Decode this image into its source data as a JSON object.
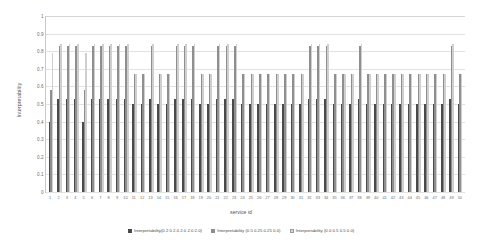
{
  "chart_data": {
    "type": "bar",
    "title": "",
    "xlabel": "service id",
    "ylabel": "Interpretability",
    "ylim": [
      0,
      1
    ],
    "ytick_labels": [
      "0",
      "0.1",
      "0.2",
      "0.3",
      "0.4",
      "0.5",
      "0.6",
      "0.7",
      "0.8",
      "0.9",
      "1"
    ],
    "ytick_values": [
      0,
      0.1,
      0.2,
      0.3,
      0.4,
      0.5,
      0.6,
      0.7,
      0.8,
      0.9,
      1
    ],
    "grid": true,
    "legend_position": "bottom",
    "categories": [
      "1",
      "2",
      "3",
      "4",
      "5",
      "6",
      "7",
      "8",
      "9",
      "10",
      "11",
      "12",
      "13",
      "14",
      "15",
      "16",
      "17",
      "18",
      "19",
      "20",
      "21",
      "22",
      "23",
      "24",
      "25",
      "26",
      "27",
      "28",
      "29",
      "30",
      "31",
      "32",
      "33",
      "34",
      "35",
      "36",
      "37",
      "38",
      "39",
      "40",
      "41",
      "42",
      "43",
      "44",
      "45",
      "46",
      "47",
      "48",
      "49",
      "50"
    ],
    "series": [
      {
        "name": "Interpretability(0.2 0 2.0 2.0 2.0 2.0)",
        "color": "#4a4a4a",
        "values": [
          0.4,
          0.53,
          0.53,
          0.53,
          0.4,
          0.53,
          0.53,
          0.53,
          0.53,
          0.53,
          0.5,
          0.5,
          0.53,
          0.5,
          0.5,
          0.53,
          0.53,
          0.53,
          0.5,
          0.5,
          0.53,
          0.53,
          0.53,
          0.5,
          0.5,
          0.5,
          0.5,
          0.5,
          0.5,
          0.5,
          0.5,
          0.53,
          0.53,
          0.53,
          0.5,
          0.5,
          0.5,
          0.53,
          0.5,
          0.5,
          0.5,
          0.5,
          0.5,
          0.5,
          0.5,
          0.5,
          0.5,
          0.5,
          0.53,
          0.5
        ]
      },
      {
        "name": "Interpretability (0.5 0.25 0.25 0.0)",
        "color": "#8f8f8f",
        "values": [
          0.58,
          0.83,
          0.83,
          0.83,
          0.58,
          0.83,
          0.83,
          0.83,
          0.83,
          0.83,
          0.67,
          0.67,
          0.83,
          0.67,
          0.67,
          0.83,
          0.83,
          0.83,
          0.67,
          0.67,
          0.83,
          0.83,
          0.83,
          0.67,
          0.67,
          0.67,
          0.67,
          0.67,
          0.67,
          0.67,
          0.67,
          0.83,
          0.83,
          0.83,
          0.67,
          0.67,
          0.67,
          0.83,
          0.67,
          0.67,
          0.67,
          0.67,
          0.67,
          0.67,
          0.67,
          0.67,
          0.67,
          0.67,
          0.83,
          0.67
        ]
      },
      {
        "name": "Interpretability (0.0 0.5 0.5 0.0)",
        "color": "#cfcfcf",
        "values": [
          0.79,
          0.84,
          0.84,
          0.84,
          0.79,
          0.84,
          0.84,
          0.84,
          0.84,
          0.84,
          0.67,
          0.67,
          0.84,
          0.67,
          0.67,
          0.84,
          0.84,
          0.84,
          0.67,
          0.67,
          0.84,
          0.84,
          0.84,
          0.67,
          0.67,
          0.67,
          0.67,
          0.67,
          0.67,
          0.67,
          0.67,
          0.84,
          0.84,
          0.84,
          0.67,
          0.67,
          0.67,
          0.84,
          0.67,
          0.67,
          0.67,
          0.67,
          0.67,
          0.67,
          0.67,
          0.67,
          0.67,
          0.67,
          0.84,
          0.67
        ]
      }
    ]
  }
}
